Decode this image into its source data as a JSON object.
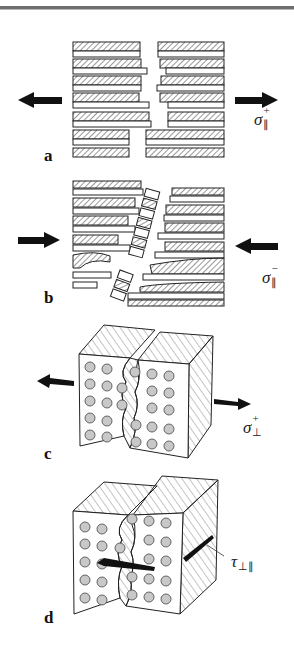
{
  "figure": {
    "panels": [
      {
        "id": "a",
        "label": "a",
        "load": "tension parallel to fibres",
        "symbol": {
          "base": "σ",
          "sup": "+",
          "sub": "∥"
        }
      },
      {
        "id": "b",
        "label": "b",
        "load": "compression parallel to fibres",
        "symbol": {
          "base": "σ",
          "sup": "−",
          "sub": "∥"
        }
      },
      {
        "id": "c",
        "label": "c",
        "load": "tension perpendicular to fibres",
        "symbol": {
          "base": "σ",
          "sup": "+",
          "sub": "⊥"
        }
      },
      {
        "id": "d",
        "label": "d",
        "load": "shear perpendicular/parallel",
        "symbol": {
          "base": "τ",
          "sup": "",
          "sub": "⊥∥"
        }
      }
    ],
    "colors": {
      "line": "#222222",
      "fibre_dot": "#c8c8c8",
      "arrow": "#111111"
    }
  }
}
